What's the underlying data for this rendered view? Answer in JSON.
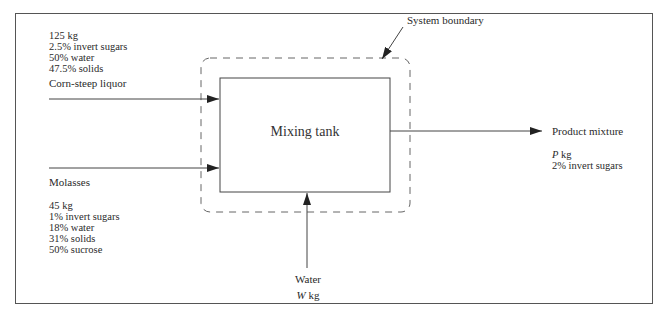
{
  "diagram": {
    "type": "process-flow / mass-balance",
    "unit": {
      "label": "Mixing tank"
    },
    "system_boundary": {
      "label": "System boundary"
    },
    "streams": [
      {
        "name": "Corn-steep liquor",
        "direction": "input",
        "details": [
          "125 kg",
          "2.5% invert sugars",
          "50% water",
          "47.5% solids"
        ]
      },
      {
        "name": "Molasses",
        "direction": "input",
        "details": [
          "45 kg",
          "1% invert sugars",
          "18% water",
          "31% solids",
          "50% sucrose"
        ]
      },
      {
        "name": "Water",
        "direction": "input",
        "amount_var": "W",
        "amount_unit": "kg"
      },
      {
        "name": "Product mixture",
        "direction": "output",
        "amount_var": "P",
        "amount_unit": "kg",
        "details": [
          "2% invert sugars"
        ]
      }
    ]
  },
  "colors": {
    "line": "#333333",
    "frame": "#555555",
    "dash": "#666666"
  }
}
